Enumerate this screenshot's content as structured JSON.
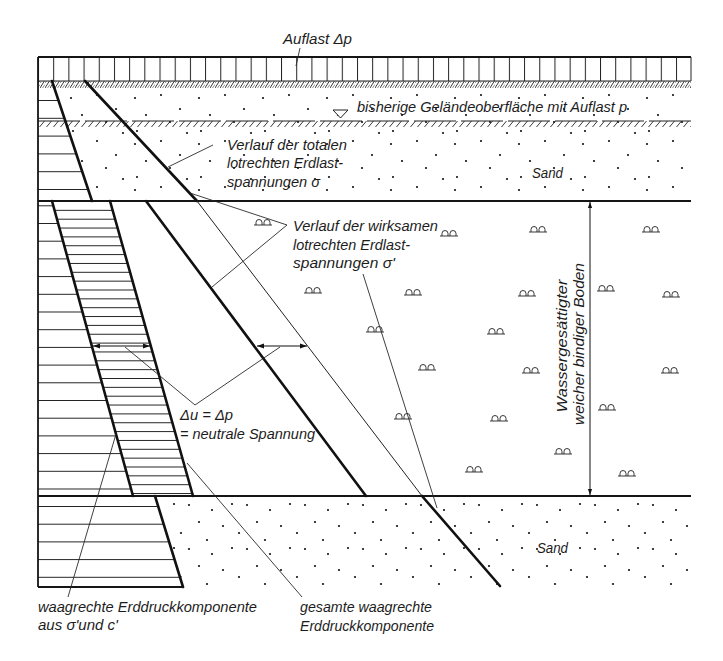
{
  "figure": {
    "load_label": "Auflast Δp",
    "previous_surface_label": "bisherige Geländeoberfläche mit Auflast p",
    "upper_sand_label": "Sand",
    "lower_sand_label": "Sand",
    "total_stress_label": [
      "Verlauf der totalen",
      "lotrechten Erdlast-",
      "spannungen σ"
    ],
    "effective_stress_label": [
      "Verlauf der wirksamen",
      "lotrechten Erdlast-",
      "spannungen σ'"
    ],
    "pore_pressure_label": [
      "Δu = Δp",
      "= neutrale Spannung"
    ],
    "clay_layer_label": [
      "Wassergesättigter",
      "weicher bindiger Boden"
    ],
    "horizontal_component_label": [
      "waagrechte Erddruckkomponente",
      "aus σ'und c'"
    ],
    "total_horizontal_label": [
      "gesamte waagrechte",
      "Erddruckkomponente"
    ]
  },
  "colors": {
    "line": "#111111",
    "background": "#ffffff"
  }
}
